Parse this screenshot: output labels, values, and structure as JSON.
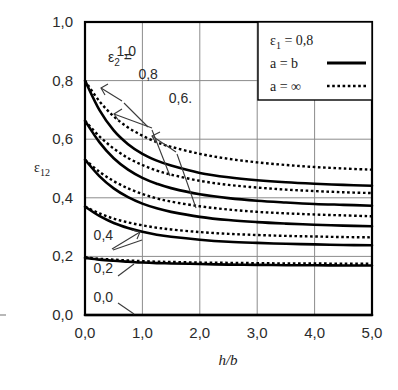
{
  "chart_data": {
    "type": "line",
    "title": "",
    "xlabel": "h/b",
    "ylabel": "ε12",
    "xlim": [
      0.0,
      5.0
    ],
    "ylim": [
      0.0,
      1.0
    ],
    "grid": true,
    "x_ticks": [
      "0,0",
      "1,0",
      "2,0",
      "3,0",
      "4,0",
      "5,0"
    ],
    "x_tick_values": [
      0.0,
      1.0,
      2.0,
      3.0,
      4.0,
      5.0
    ],
    "y_ticks": [
      "0,0",
      "0,2",
      "0,4",
      "0,6",
      "0,8",
      "1,0"
    ],
    "y_tick_values": [
      0.0,
      0.2,
      0.4,
      0.6,
      0.8,
      1.0
    ],
    "legend_position": "top-right",
    "legend": {
      "condition": "ε1 = 0,8",
      "condition_symbol": "ε",
      "condition_sub": "1",
      "condition_value": "= 0,8",
      "entries": [
        {
          "label": "a = b",
          "style": "solid"
        },
        {
          "label": "a = ∞",
          "style": "dotted"
        }
      ]
    },
    "family_label": "ε2 =",
    "family_label_symbol": "ε",
    "family_label_sub": "2",
    "family_label_eq": "=",
    "x": [
      0.0,
      0.25,
      0.5,
      0.75,
      1.0,
      1.25,
      1.5,
      2.0,
      2.5,
      3.0,
      3.5,
      4.0,
      4.5,
      5.0
    ],
    "series": [
      {
        "name": "ε2 = 1,0",
        "label": "1,0",
        "style": "solid",
        "values": [
          0.8,
          0.7,
          0.63,
          0.583,
          0.55,
          0.527,
          0.51,
          0.485,
          0.47,
          0.46,
          0.453,
          0.448,
          0.444,
          0.441
        ]
      },
      {
        "name": "ε2 = 1,0 (a = ∞)",
        "label": "1,0",
        "style": "dotted",
        "values": [
          0.8,
          0.73,
          0.678,
          0.64,
          0.612,
          0.59,
          0.574,
          0.55,
          0.533,
          0.521,
          0.512,
          0.505,
          0.5,
          0.496
        ]
      },
      {
        "name": "ε2 = 0,8",
        "label": "0,8",
        "style": "solid",
        "values": [
          0.663,
          0.59,
          0.535,
          0.496,
          0.468,
          0.448,
          0.433,
          0.412,
          0.399,
          0.39,
          0.384,
          0.379,
          0.376,
          0.373
        ]
      },
      {
        "name": "ε2 = 0,8 (a = ∞)",
        "label": "0,8",
        "style": "dotted",
        "values": [
          0.663,
          0.61,
          0.568,
          0.536,
          0.512,
          0.493,
          0.479,
          0.458,
          0.444,
          0.435,
          0.428,
          0.423,
          0.419,
          0.416
        ]
      },
      {
        "name": "ε2 = 0,6",
        "label": "0,6.",
        "style": "solid",
        "values": [
          0.53,
          0.474,
          0.432,
          0.402,
          0.38,
          0.364,
          0.352,
          0.335,
          0.324,
          0.317,
          0.312,
          0.308,
          0.305,
          0.303
        ]
      },
      {
        "name": "ε2 = 0,6 (a = ∞)",
        "label": "0,6.",
        "style": "dotted",
        "values": [
          0.53,
          0.489,
          0.457,
          0.432,
          0.413,
          0.398,
          0.387,
          0.371,
          0.36,
          0.352,
          0.347,
          0.343,
          0.34,
          0.337
        ]
      },
      {
        "name": "ε2 = 0,4",
        "label": "0,4",
        "style": "solid",
        "values": [
          0.37,
          0.338,
          0.314,
          0.297,
          0.284,
          0.274,
          0.267,
          0.257,
          0.25,
          0.246,
          0.243,
          0.241,
          0.239,
          0.238
        ]
      },
      {
        "name": "ε2 = 0,4 (a = ∞)",
        "label": "0,4",
        "style": "dotted",
        "values": [
          0.37,
          0.347,
          0.329,
          0.316,
          0.306,
          0.298,
          0.292,
          0.283,
          0.277,
          0.273,
          0.27,
          0.268,
          0.266,
          0.265
        ]
      },
      {
        "name": "ε2 = 0,2",
        "label": "0,2",
        "style": "solid",
        "values": [
          0.195,
          0.189,
          0.185,
          0.182,
          0.179,
          0.177,
          0.176,
          0.174,
          0.172,
          0.171,
          0.17,
          0.17,
          0.169,
          0.169
        ]
      },
      {
        "name": "ε2 = 0,2 (a = ∞)",
        "label": "0,2",
        "style": "dotted",
        "values": [
          0.197,
          0.192,
          0.189,
          0.186,
          0.184,
          0.182,
          0.181,
          0.179,
          0.178,
          0.177,
          0.176,
          0.176,
          0.175,
          0.175
        ]
      },
      {
        "name": "ε2 = 0,0",
        "label": "0,0",
        "style": "solid",
        "values": [
          0.0,
          0.0,
          0.0,
          0.0,
          0.0,
          0.0,
          0.0,
          0.0,
          0.0,
          0.0,
          0.0,
          0.0,
          0.0,
          0.0
        ]
      }
    ],
    "curve_labels": [
      {
        "text": "1,0",
        "x": 0.55,
        "y": 0.885
      },
      {
        "text": "0,8",
        "x": 0.93,
        "y": 0.805
      },
      {
        "text": "0,6.",
        "x": 1.46,
        "y": 0.725
      },
      {
        "text": "0,4",
        "x": 0.15,
        "y": 0.255
      },
      {
        "text": "0,2",
        "x": 0.15,
        "y": 0.145
      },
      {
        "text": "0,0",
        "x": 0.15,
        "y": 0.045
      }
    ]
  },
  "colors": {
    "ink": "#000000",
    "grid": "#8c8c8c",
    "text": "#2b2b2b",
    "background": "#ffffff"
  }
}
